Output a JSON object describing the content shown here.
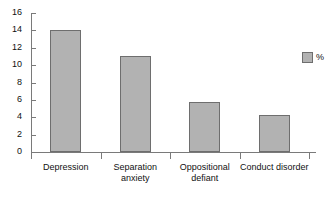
{
  "chart_data": {
    "type": "bar",
    "title": "",
    "xlabel": "",
    "ylabel": "",
    "categories": [
      "Depression",
      "Separation anxiety",
      "Oppositional\ndefiant",
      "Conduct disorder"
    ],
    "values": [
      14,
      11,
      5.8,
      4.3
    ],
    "series": [
      {
        "name": "%",
        "values": [
          14,
          11,
          5.8,
          4.3
        ]
      }
    ],
    "ylim": [
      0,
      16
    ],
    "ytick_step": 2,
    "yticks": [
      0,
      2,
      4,
      6,
      8,
      10,
      12,
      14,
      16
    ],
    "ytick_labels": [
      "0",
      "2",
      "4",
      "6",
      "8",
      "10",
      "12",
      "14",
      "16"
    ],
    "grid": false,
    "legend": {
      "position": "right",
      "entries": [
        {
          "label": "%",
          "color": "#b2b2b2"
        }
      ]
    },
    "colors": {
      "bar_fill": "#b2b2b2",
      "bar_border": "#6e6e6e",
      "axis": "#7a7a7a",
      "text": "#111111",
      "background": "#ffffff"
    }
  }
}
